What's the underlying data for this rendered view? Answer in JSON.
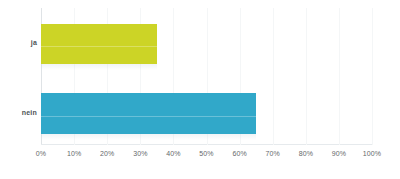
{
  "chart_data": {
    "type": "bar",
    "orientation": "horizontal",
    "title": "",
    "subtitle": "",
    "xlabel": "",
    "ylabel": "",
    "categories": [
      "ja",
      "nein"
    ],
    "values": [
      35,
      65
    ],
    "value_suffix": "%",
    "xlim": [
      0,
      100
    ],
    "xticks": [
      0,
      10,
      20,
      30,
      40,
      50,
      60,
      70,
      80,
      90,
      100
    ],
    "xtick_labels": [
      "0%",
      "10%",
      "20%",
      "30%",
      "40%",
      "50%",
      "60%",
      "70%",
      "80%",
      "90%",
      "100%"
    ],
    "grid": true,
    "legend": false,
    "legend_position": "none",
    "series": [
      {
        "name": "ja",
        "value": 35,
        "color": "#ccd426"
      },
      {
        "name": "nein",
        "value": 65,
        "color": "#31a8c9"
      }
    ],
    "colors": {
      "ja": "#ccd426",
      "nein": "#31a8c9",
      "background": "#ffffff",
      "axis": "#dfe3e6",
      "grid": "#f4f6f7",
      "tick_text": "#65696b",
      "category_text": "#4d5356"
    }
  }
}
